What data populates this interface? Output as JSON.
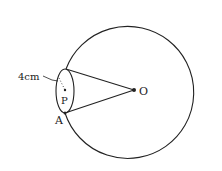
{
  "diagram": {
    "type": "geometry",
    "labels": {
      "center": "O",
      "point_p": "P",
      "point_a": "A",
      "dimension": "4cm"
    },
    "shapes": {
      "circle": {
        "cx": 141,
        "cy": 93,
        "r": 66
      },
      "ellipse": {
        "cx": 65,
        "cy": 91,
        "rx": 9,
        "ry": 22
      },
      "cone_apex": {
        "x": 134,
        "y": 90
      }
    },
    "colors": {
      "stroke": "#222222",
      "background": "#ffffff"
    }
  }
}
